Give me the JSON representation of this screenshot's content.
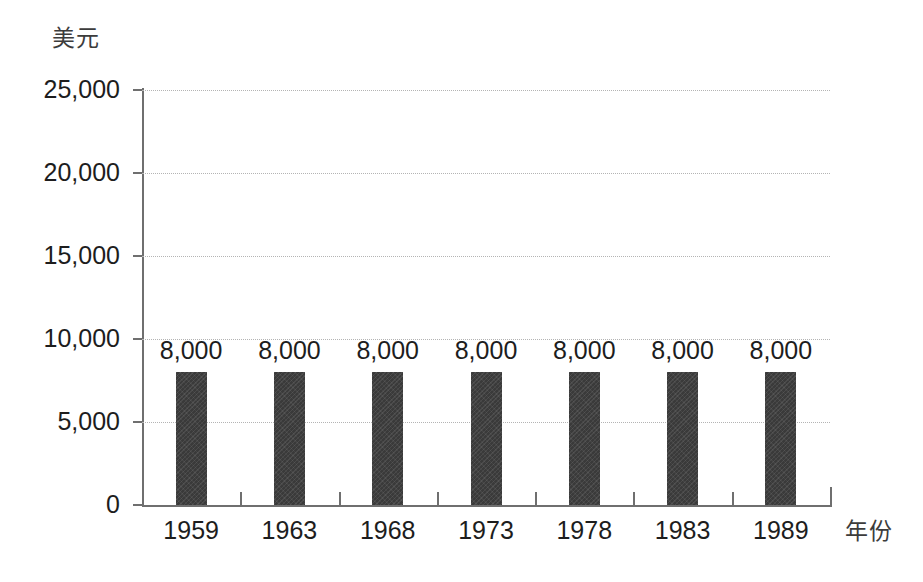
{
  "chart_data": {
    "type": "bar",
    "title": "",
    "subtitle": "",
    "xlabel": "年份",
    "ylabel": "美元",
    "categories": [
      "1959",
      "1963",
      "1968",
      "1973",
      "1978",
      "1983",
      "1989"
    ],
    "values": [
      8000,
      8000,
      8000,
      8000,
      8000,
      8000,
      8000
    ],
    "data_labels": [
      "8,000",
      "8,000",
      "8,000",
      "8,000",
      "8,000",
      "8,000",
      "8,000"
    ],
    "ylim": [
      0,
      25000
    ],
    "ytick_values": [
      0,
      5000,
      10000,
      15000,
      20000,
      25000
    ],
    "ytick_labels": [
      "0",
      "5,000",
      "10,000",
      "15,000",
      "20,000",
      "25,000"
    ],
    "grid": true,
    "grid_axis": "y",
    "grid_style": "dotted",
    "legend": false,
    "legend_position": "none",
    "series": [
      {
        "name": "",
        "values": [
          8000,
          8000,
          8000,
          8000,
          8000,
          8000,
          8000
        ],
        "color": "#3a3a3a"
      }
    ]
  },
  "colors": {
    "background": "#ffffff",
    "bar": "#3a3a3a",
    "axis": "#6f6f6f",
    "gridline": "#b4b4b4",
    "text": "#1d1d1d",
    "axis_title_text": "#3c3c3c"
  }
}
